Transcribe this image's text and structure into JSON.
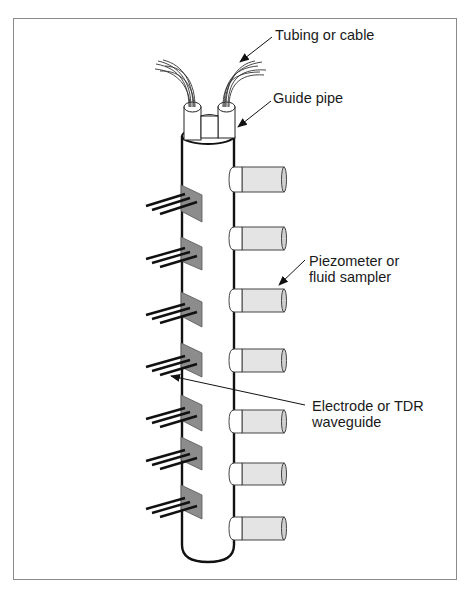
{
  "figure": {
    "type": "diagram",
    "labels": {
      "tubing": "Tubing or cable",
      "guide_pipe": "Guide pipe",
      "piezometer_line1": "Piezometer or",
      "piezometer_line2": "fluid sampler",
      "electrode_line1": "Electrode or TDR",
      "electrode_line2": "waveguide"
    },
    "components": {
      "piezometer_count": 7,
      "electrode_count": 7,
      "rods_per_electrode": 3,
      "tubes_at_top": 2
    },
    "colors": {
      "line": "#111111",
      "plate_fill": "#8c8c8c",
      "cylinder_fill": "#e4e4e4",
      "cylinder_cap": "#ffffff",
      "frame": "#8a8a8a"
    }
  }
}
